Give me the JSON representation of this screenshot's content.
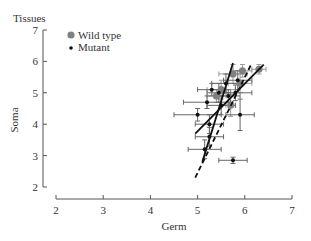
{
  "chart_data": {
    "type": "scatter",
    "title": "Tissues",
    "xlabel": "Germ",
    "ylabel": "Soma",
    "xlim": [
      2,
      7
    ],
    "ylim": [
      2,
      7
    ],
    "xticks": [
      2,
      3,
      4,
      5,
      6,
      7
    ],
    "yticks": [
      2,
      3,
      4,
      5,
      6,
      7
    ],
    "grid": false,
    "legend_position": "upper-left",
    "series": [
      {
        "name": "Wild type",
        "marker": "large-gray-circle",
        "color": "#808080",
        "points": [
          {
            "x": 5.75,
            "y": 5.6,
            "xerr": 0.3,
            "yerr": 0.3
          },
          {
            "x": 6.3,
            "y": 5.75,
            "xerr": 0.15,
            "yerr": 0.15
          },
          {
            "x": 5.95,
            "y": 5.7,
            "xerr": 0.2,
            "yerr": 0.2
          },
          {
            "x": 5.9,
            "y": 5.3,
            "xerr": 0.25,
            "yerr": 0.3
          },
          {
            "x": 5.5,
            "y": 5.1,
            "xerr": 0.3,
            "yerr": 0.3
          },
          {
            "x": 5.7,
            "y": 4.6,
            "xerr": 0.1,
            "yerr": 0.35
          },
          {
            "x": 5.4,
            "y": 4.9,
            "xerr": 0.2,
            "yerr": 0.2
          }
        ]
      },
      {
        "name": "Mutant",
        "marker": "small-black-circle",
        "color": "#111111",
        "points": [
          {
            "x": 5.15,
            "y": 3.2,
            "xerr": 0.35,
            "yerr": 0.3
          },
          {
            "x": 5.25,
            "y": 3.6,
            "xerr": 0.3,
            "yerr": 0.3
          },
          {
            "x": 5.25,
            "y": 4.0,
            "xerr": 0.3,
            "yerr": 0.3
          },
          {
            "x": 5.9,
            "y": 4.3,
            "xerr": 0.3,
            "yerr": 0.5
          },
          {
            "x": 5.75,
            "y": 2.85,
            "xerr": 0.3,
            "yerr": 0.1
          },
          {
            "x": 5.0,
            "y": 4.3,
            "xerr": 0.5,
            "yerr": 0.2
          },
          {
            "x": 5.2,
            "y": 4.7,
            "xerr": 0.5,
            "yerr": 0.2
          },
          {
            "x": 5.5,
            "y": 4.6,
            "xerr": 0.3,
            "yerr": 0.3
          },
          {
            "x": 5.45,
            "y": 5.0,
            "xerr": 0.25,
            "yerr": 0.3
          },
          {
            "x": 5.3,
            "y": 5.1,
            "xerr": 0.3,
            "yerr": 0.2
          },
          {
            "x": 5.65,
            "y": 4.9,
            "xerr": 0.25,
            "yerr": 0.2
          },
          {
            "x": 5.6,
            "y": 5.3,
            "xerr": 0.3,
            "yerr": 0.3
          },
          {
            "x": 5.8,
            "y": 5.0,
            "xerr": 0.35,
            "yerr": 0.25
          },
          {
            "x": 5.85,
            "y": 5.4,
            "xerr": 0.3,
            "yerr": 0.3
          }
        ]
      }
    ],
    "fit_lines": [
      {
        "style": "solid",
        "from": [
          5.1,
          2.8
        ],
        "to": [
          5.75,
          5.95
        ]
      },
      {
        "style": "solid",
        "from": [
          4.95,
          3.7
        ],
        "to": [
          6.4,
          5.9
        ]
      },
      {
        "style": "dashed",
        "from": [
          4.95,
          2.3
        ],
        "to": [
          6.15,
          5.95
        ]
      }
    ]
  },
  "plot_frame": {
    "y_axis_x": 43,
    "y_top": 30,
    "y_bottom": 187,
    "x_axis_y": 199,
    "x_left": 56,
    "x_right": 292
  }
}
